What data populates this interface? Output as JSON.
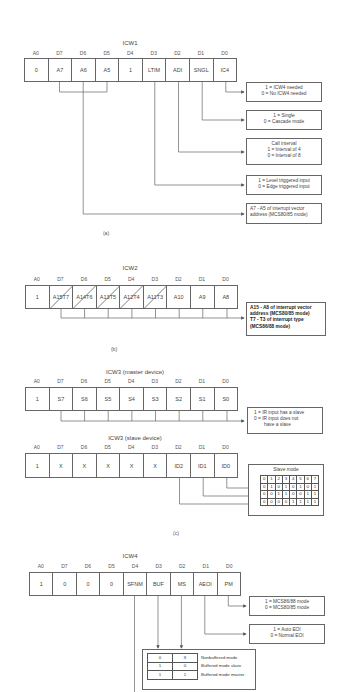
{
  "icw1": {
    "title": "ICW1",
    "bit_labels": [
      "A0",
      "D7",
      "D6",
      "D5",
      "D4",
      "D3",
      "D2",
      "D1",
      "D0"
    ],
    "cells": [
      "0",
      "A7",
      "A6",
      "A5",
      "1",
      "LTIM",
      "ADI",
      "SNGL",
      "IC4"
    ],
    "descriptions": [
      {
        "lines": [
          "1 = ICW4 needed",
          "0 = No ICW4 needed"
        ]
      },
      {
        "lines": [
          "1 = Single",
          "0 = Cascade mode"
        ]
      },
      {
        "lines": [
          "Call interval",
          "1 = Interval of 4",
          "0 = Interval of 8"
        ]
      },
      {
        "lines": [
          "1 = Level triggered input",
          "0 = Edge triggered input"
        ]
      },
      {
        "lines": [
          "A7 - A5 of interrupt vector",
          "address (MCS80/85 mode)"
        ]
      }
    ],
    "caption": "(a)"
  },
  "icw2": {
    "title": "ICW2",
    "bit_labels": [
      "A0",
      "D7",
      "D6",
      "D5",
      "D4",
      "D3",
      "D2",
      "D1",
      "D0"
    ],
    "cells": [
      {
        "text": "1"
      },
      {
        "top": "A15",
        "bottom": "T7"
      },
      {
        "top": "A14",
        "bottom": "T6"
      },
      {
        "top": "A13",
        "bottom": "T5"
      },
      {
        "top": "A12",
        "bottom": "T4"
      },
      {
        "top": "A11",
        "bottom": "T3"
      },
      {
        "text": "A10"
      },
      {
        "text": "A9"
      },
      {
        "text": "A8"
      }
    ],
    "description": {
      "lines": [
        "A15 - A8 of interrupt vector",
        "address (MCS80/85 mode)",
        "T7 - T3 of interrupt type",
        "(MCS86/88 mode)"
      ]
    },
    "caption": "(b)"
  },
  "icw3_master": {
    "title": "ICW3 (master device)",
    "bit_labels": [
      "A0",
      "D7",
      "D6",
      "D5",
      "D4",
      "D3",
      "D2",
      "D1",
      "D0"
    ],
    "cells": [
      "1",
      "S7",
      "S6",
      "S5",
      "S4",
      "S3",
      "S2",
      "S1",
      "S0"
    ],
    "description": {
      "lines": [
        "1 = IR input has a slave",
        "0 = IR input does not",
        "have a slave"
      ]
    }
  },
  "icw3_slave": {
    "title": "ICW3 (slave device)",
    "bit_labels": [
      "A0",
      "D7",
      "D6",
      "D5",
      "D4",
      "D3",
      "D2",
      "D1",
      "D0"
    ],
    "cells": [
      "1",
      "X",
      "X",
      "X",
      "X",
      "X",
      "ID2",
      "ID1",
      "ID0"
    ],
    "slave_mode": {
      "title": "Slave mode",
      "rows": [
        [
          "0",
          "1",
          "2",
          "3",
          "4",
          "5",
          "6",
          "7"
        ],
        [
          "0",
          "1",
          "0",
          "1",
          "0",
          "1",
          "0",
          "1"
        ],
        [
          "0",
          "0",
          "1",
          "1",
          "0",
          "0",
          "1",
          "1"
        ],
        [
          "0",
          "0",
          "0",
          "0",
          "1",
          "1",
          "1",
          "1"
        ]
      ]
    },
    "caption": "(c)"
  },
  "icw4": {
    "title": "ICW4",
    "bit_labels": [
      "A0",
      "D7",
      "D6",
      "D5",
      "D4",
      "D3",
      "D2",
      "D1",
      "D0"
    ],
    "cells": [
      "1",
      "0",
      "0",
      "0",
      "SFNM",
      "BUF",
      "MS",
      "AEOI",
      "PM"
    ],
    "descriptions": [
      {
        "lines": [
          "1 = MCS86/88 mode",
          "0 = MCS80/85 mode"
        ]
      },
      {
        "lines": [
          "1 = Auto EOI",
          "0 = Normal EOI"
        ]
      }
    ],
    "buffer_table": [
      {
        "buf": "0",
        "ms": "X",
        "desc": "Nonbuffered mode"
      },
      {
        "buf": "1",
        "ms": "0",
        "desc": "Buffered mode slave"
      },
      {
        "buf": "1",
        "ms": "1",
        "desc": "Buffered mode master"
      }
    ]
  }
}
